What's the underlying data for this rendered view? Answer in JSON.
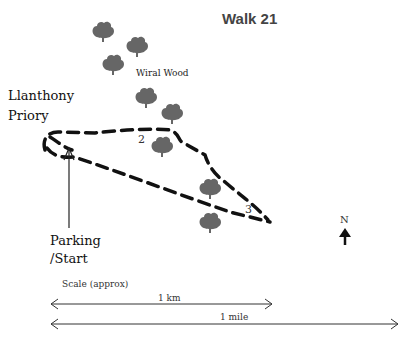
{
  "title": "Walk 21",
  "labels": {
    "priory_line1": "Llanthony",
    "priory_line2": "Priory",
    "wood": "Wiral Wood",
    "parking_line1": "Parking",
    "parking_line2": "/Start",
    "scale": "Scale (approx)",
    "km": "1 km",
    "mile": "1 mile",
    "north": "N"
  },
  "waypoints": [
    {
      "id": "2",
      "label": "2"
    },
    {
      "id": "3",
      "label": "3"
    }
  ],
  "trees": [
    {
      "x": 103,
      "y": 33
    },
    {
      "x": 137,
      "y": 48
    },
    {
      "x": 113,
      "y": 66
    },
    {
      "x": 146,
      "y": 99
    },
    {
      "x": 172,
      "y": 115
    },
    {
      "x": 162,
      "y": 148
    },
    {
      "x": 210,
      "y": 190
    },
    {
      "x": 210,
      "y": 224
    }
  ],
  "colors": {
    "tree": "#666666",
    "route": "#111111",
    "text": "#111111"
  }
}
